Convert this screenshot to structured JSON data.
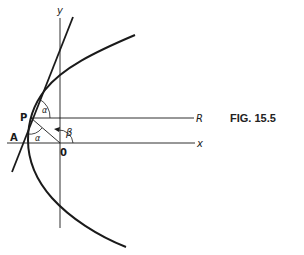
{
  "figure": {
    "caption": "FIG. 15.5",
    "labels": {
      "y_axis": "y",
      "x_axis": "x",
      "origin": "0",
      "point_p": "P",
      "point_a": "A",
      "point_r": "R",
      "alpha_upper": "α",
      "alpha_lower": "α",
      "beta": "β"
    },
    "colors": {
      "ink": "#1a1a1a",
      "background": "#ffffff"
    }
  }
}
